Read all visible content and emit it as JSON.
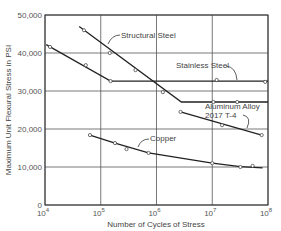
{
  "chart_data": {
    "type": "line",
    "title": "",
    "xlabel": "Number of Cycles of Stress",
    "ylabel": "Maximum Unit Flexural Stress in PSI",
    "x_scale": "log",
    "xlim": [
      10000,
      100000000
    ],
    "ylim": [
      0,
      50000
    ],
    "grid": true,
    "x_ticks": [
      {
        "value": 10000,
        "base": "10",
        "exp": "4"
      },
      {
        "value": 100000,
        "base": "10",
        "exp": "5"
      },
      {
        "value": 1000000,
        "base": "10",
        "exp": "6"
      },
      {
        "value": 10000000,
        "base": "10",
        "exp": "7"
      },
      {
        "value": 100000000,
        "base": "10",
        "exp": "8"
      }
    ],
    "y_ticks": [
      "0",
      "10,000",
      "20,000",
      "30,000",
      "40,000",
      "50,000"
    ],
    "y_tick_values": [
      0,
      10000,
      20000,
      30000,
      40000,
      50000
    ],
    "series": [
      {
        "name": "Structural Steel",
        "line": [
          [
            41000,
            47000
          ],
          [
            2800000,
            27100
          ],
          [
            100000000,
            27100
          ]
        ],
        "points": [
          [
            50000,
            46000
          ],
          [
            145000,
            40000
          ],
          [
            420000,
            35500
          ],
          [
            1300000,
            29700
          ],
          [
            10500000,
            27100
          ],
          [
            28000000,
            27100
          ]
        ]
      },
      {
        "name": "Stainless Steel",
        "line": [
          [
            10500,
            42200
          ],
          [
            150000,
            32600
          ],
          [
            100000000,
            32600
          ]
        ],
        "points": [
          [
            12300,
            41600
          ],
          [
            54000,
            36800
          ],
          [
            150000,
            32600
          ],
          [
            12000000,
            32900
          ],
          [
            89000000,
            32400
          ]
        ]
      },
      {
        "name": "Aluminum Alloy 2017 T-4",
        "line": [
          [
            2700000,
            24500
          ],
          [
            77000000,
            18400
          ]
        ],
        "points": [
          [
            2700000,
            24500
          ],
          [
            15000000,
            21000
          ],
          [
            77000000,
            18400
          ]
        ]
      },
      {
        "name": "Copper",
        "line": [
          [
            64000,
            18400
          ],
          [
            180000,
            16300
          ],
          [
            720000,
            13700
          ],
          [
            10000000,
            11000
          ],
          [
            32000000,
            10100
          ],
          [
            80000000,
            9800
          ]
        ],
        "points": [
          [
            64000,
            18400
          ],
          [
            180000,
            16300
          ],
          [
            290000,
            14700
          ],
          [
            720000,
            13700
          ],
          [
            10000000,
            11000
          ],
          [
            32000000,
            10000
          ],
          [
            53000000,
            10300
          ]
        ]
      }
    ],
    "annotations": [
      {
        "text": "Structural Steel"
      },
      {
        "text": "Stainless Steel"
      },
      {
        "text": "Aluminum Alloy",
        "text2": "2017  T-4"
      },
      {
        "text": "Copper"
      }
    ],
    "legend": "none (inline annotations)"
  }
}
